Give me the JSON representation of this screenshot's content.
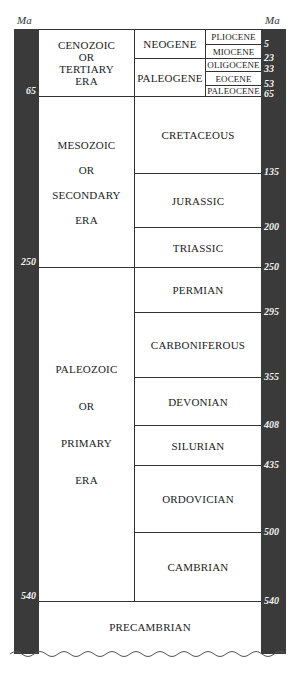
{
  "axis": {
    "unit_left": "Ma",
    "unit_right": "Ma",
    "left_ticks": [
      "65",
      "250",
      "540"
    ],
    "right_ticks": [
      "5",
      "23",
      "33",
      "53",
      "65",
      "135",
      "200",
      "250",
      "295",
      "355",
      "408",
      "435",
      "500",
      "540"
    ]
  },
  "eras": [
    {
      "lines": [
        "CENOZOIC",
        "OR",
        "TERTIARY",
        "ERA"
      ],
      "start_ma": 0,
      "end_ma": 65
    },
    {
      "lines": [
        "MESOZOIC",
        "OR",
        "SECONDARY",
        "ERA"
      ],
      "start_ma": 65,
      "end_ma": 250
    },
    {
      "lines": [
        "PALEOZOIC",
        "OR",
        "PRIMARY",
        "ERA"
      ],
      "start_ma": 250,
      "end_ma": 540
    }
  ],
  "periods": [
    {
      "label": "NEOGENE",
      "end_ma": 23
    },
    {
      "label": "PALEOGENE",
      "end_ma": 65
    },
    {
      "label": "CRETACEOUS",
      "end_ma": 135
    },
    {
      "label": "JURASSIC",
      "end_ma": 200
    },
    {
      "label": "TRIASSIC",
      "end_ma": 250
    },
    {
      "label": "PERMIAN",
      "end_ma": 295
    },
    {
      "label": "CARBONIFEROUS",
      "end_ma": 355
    },
    {
      "label": "DEVONIAN",
      "end_ma": 408
    },
    {
      "label": "SILURIAN",
      "end_ma": 435
    },
    {
      "label": "ORDOVICIAN",
      "end_ma": 500
    },
    {
      "label": "CAMBRIAN",
      "end_ma": 540
    }
  ],
  "epochs": [
    {
      "label": "PLIOCENE",
      "end_ma": 5
    },
    {
      "label": "MIOCENE",
      "end_ma": 23
    },
    {
      "label": "OLIGOCENE",
      "end_ma": 33
    },
    {
      "label": "EOCENE",
      "end_ma": 53
    },
    {
      "label": "PALEOCENE",
      "end_ma": 65
    }
  ],
  "bottom": {
    "label": "PRECAMBRIAN"
  }
}
